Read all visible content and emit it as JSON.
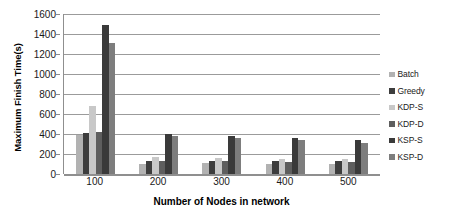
{
  "chart_data": {
    "type": "bar",
    "title": "",
    "subtitle": "",
    "xlabel": "Number of Nodes in network",
    "ylabel": "Maximum Finish Time(s)",
    "categories": [
      "100",
      "200",
      "300",
      "400",
      "500"
    ],
    "ylim": [
      0,
      1600
    ],
    "ytick_step": 200,
    "yticks": [
      "1600",
      "1400",
      "1200",
      "1000",
      "800",
      "600",
      "400",
      "200",
      "0"
    ],
    "grid": true,
    "legend_position": "right",
    "series": [
      {
        "name": "Batch",
        "color": "#b2b2b2",
        "values": [
          390,
          100,
          110,
          100,
          100
        ]
      },
      {
        "name": "Greedy",
        "color": "#3d3d3d",
        "values": [
          410,
          130,
          135,
          130,
          130
        ]
      },
      {
        "name": "KDP-S",
        "color": "#c8c8c8",
        "values": [
          680,
          175,
          160,
          155,
          150
        ]
      },
      {
        "name": "KDP-D",
        "color": "#5e5e5e",
        "values": [
          420,
          130,
          130,
          125,
          125
        ]
      },
      {
        "name": "KSP-S",
        "color": "#3a3a3a",
        "values": [
          1490,
          400,
          380,
          360,
          345
        ]
      },
      {
        "name": "KSP-D",
        "color": "#7d7d7d",
        "values": [
          1310,
          385,
          360,
          340,
          310
        ]
      }
    ]
  },
  "legend": {
    "items": [
      {
        "label": "Batch"
      },
      {
        "label": "Greedy"
      },
      {
        "label": "KDP-S"
      },
      {
        "label": "KDP-D"
      },
      {
        "label": "KSP-S"
      },
      {
        "label": "KSP-D"
      }
    ]
  }
}
